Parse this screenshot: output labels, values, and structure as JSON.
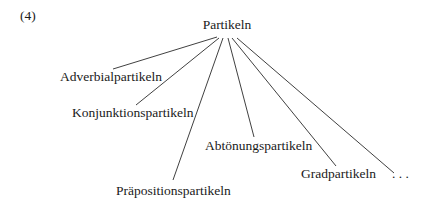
{
  "example_number": "(4)",
  "root": {
    "label": "Partikeln",
    "x": 227,
    "y": 29
  },
  "children": [
    {
      "label": "Adverbialpartikeln",
      "text_x": 60,
      "text_y": 81,
      "line": [
        217,
        37,
        113,
        69
      ]
    },
    {
      "label": "Konjunktionspartikeln",
      "text_x": 72,
      "text_y": 117,
      "line": [
        219,
        38,
        136,
        105
      ]
    },
    {
      "label": "Präpositionspartikeln",
      "text_x": 116,
      "text_y": 195,
      "line": [
        223,
        38,
        173,
        180
      ]
    },
    {
      "label": "Abtönungspartikeln",
      "text_x": 205,
      "text_y": 150,
      "line": [
        228,
        38,
        254,
        137
      ]
    },
    {
      "label": "Gradpartikeln",
      "text_x": 301,
      "text_y": 178,
      "line": [
        232,
        38,
        336,
        166
      ]
    },
    {
      "label": ". . .",
      "text_x": 392,
      "text_y": 178,
      "line": [
        237,
        38,
        394,
        173
      ]
    }
  ]
}
